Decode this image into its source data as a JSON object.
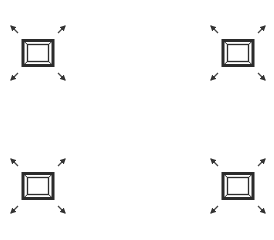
{
  "canvas": {
    "width": 274,
    "height": 228,
    "background": "#ffffff"
  },
  "icon_color": "#333333",
  "buttons": [
    {
      "id": "top-left",
      "icon": "expand-fullscreen-icon",
      "label": ""
    },
    {
      "id": "top-right",
      "icon": "expand-fullscreen-icon",
      "label": ""
    },
    {
      "id": "bottom-left",
      "icon": "expand-fullscreen-icon",
      "label": ""
    },
    {
      "id": "bottom-right",
      "icon": "expand-fullscreen-icon",
      "label": ""
    }
  ]
}
